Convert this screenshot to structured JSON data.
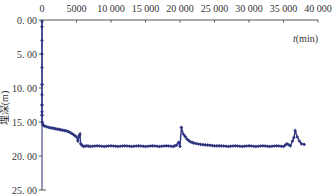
{
  "chart_data": {
    "type": "line",
    "title": "",
    "xlabel": "t(min)",
    "xlabel_italic_part": "t",
    "xlabel_unit": "(min)",
    "ylabel": "埋深(m)",
    "x_axis_position": "top",
    "y_axis_inverted": true,
    "xlim": [
      0,
      40000
    ],
    "ylim": [
      0,
      25
    ],
    "x_ticks": [
      0,
      5000,
      10000,
      15000,
      20000,
      25000,
      30000,
      35000,
      40000
    ],
    "x_tick_labels": [
      "0",
      "5000",
      "10 000",
      "15 000",
      "20 000",
      "25 000",
      "30 000",
      "35 000",
      "40 000"
    ],
    "y_ticks": [
      0,
      5,
      10,
      15,
      20,
      25
    ],
    "y_tick_labels": [
      "0. 00",
      "5. 00",
      "10. 00",
      "15. 00",
      "20. 00",
      "25. 00"
    ],
    "grid": false,
    "legend": null,
    "marker": "diamond",
    "color": "#2e3580",
    "series": [
      {
        "name": "水位埋深",
        "x": [
          0,
          0,
          0,
          0,
          50,
          100,
          200,
          400,
          700,
          1000,
          1500,
          2000,
          2500,
          3000,
          3500,
          4000,
          4500,
          5000,
          5200,
          5400,
          5500,
          5600,
          5800,
          6000,
          6500,
          7000,
          8000,
          9000,
          10000,
          11000,
          12000,
          13000,
          14000,
          15000,
          16000,
          17000,
          18000,
          19000,
          19500,
          19800,
          20000,
          20200,
          20500,
          21000,
          21500,
          22000,
          23000,
          24000,
          25000,
          26000,
          27000,
          28000,
          29000,
          30000,
          31000,
          32000,
          33000,
          34000,
          35000,
          35500,
          36000,
          36300,
          36500,
          36700,
          37000,
          37300,
          37600,
          38000
        ],
        "y": [
          0.2,
          9.5,
          12.5,
          14.0,
          15.0,
          15.3,
          15.5,
          15.6,
          15.7,
          15.8,
          15.9,
          16.0,
          16.1,
          16.2,
          16.3,
          16.5,
          16.8,
          17.2,
          17.8,
          17.0,
          16.8,
          18.2,
          18.4,
          18.6,
          18.5,
          18.6,
          18.5,
          18.6,
          18.5,
          18.6,
          18.5,
          18.6,
          18.5,
          18.6,
          18.5,
          18.6,
          18.5,
          18.6,
          18.4,
          18.0,
          18.6,
          15.8,
          16.8,
          17.5,
          17.9,
          18.1,
          18.3,
          18.4,
          18.5,
          18.5,
          18.6,
          18.5,
          18.6,
          18.5,
          18.6,
          18.5,
          18.6,
          18.5,
          18.6,
          18.2,
          18.5,
          17.8,
          17.3,
          16.3,
          17.2,
          17.8,
          18.2,
          18.3
        ]
      }
    ]
  }
}
